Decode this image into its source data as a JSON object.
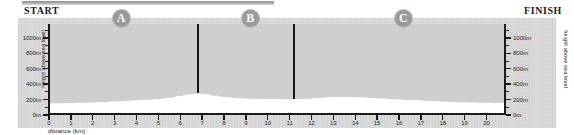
{
  "header": {
    "start_label": "START",
    "finish_label": "FINISH",
    "top_rule": "decorative-rule"
  },
  "markers": [
    {
      "label": "A",
      "km": 3.3
    },
    {
      "label": "B",
      "km": 9.2
    },
    {
      "label": "C",
      "km": 16.2
    }
  ],
  "dividers": [
    {
      "km": 6.8,
      "top_m": 1180,
      "bottom_m": 280
    },
    {
      "km": 11.2,
      "top_m": 1180,
      "bottom_m": 205
    }
  ],
  "colors": {
    "panel_bg": "#d6d6d6",
    "plot_bg": "#cfcfcf",
    "profile_fill": "#ffffff",
    "axis": "#1a1a1a",
    "marker_circle": "#9a9a9a",
    "marker_text": "#ffffff",
    "text": "#1c1c1c"
  },
  "chart_data": {
    "type": "area",
    "title": "",
    "xlabel": "distance (km)",
    "ylabel": "height above sea level",
    "ylabel_right": "height above sea level",
    "xlim": [
      0,
      20.8
    ],
    "ylim": [
      0,
      1180
    ],
    "grid": false,
    "legend": null,
    "x_ticks": [
      0,
      1,
      2,
      3,
      4,
      5,
      6,
      7,
      8,
      9,
      10,
      11,
      12,
      13,
      14,
      15,
      16,
      17,
      18,
      19,
      20
    ],
    "x_tick_labels": [
      "0",
      "1",
      "2",
      "3",
      "4",
      "5",
      "6",
      "7",
      "8",
      "9",
      "10",
      "11",
      "12",
      "13",
      "14",
      "15",
      "16",
      "17",
      "18",
      "19",
      "20"
    ],
    "y_ticks": [
      0,
      200,
      400,
      600,
      800,
      1000
    ],
    "y_tick_labels": [
      "0m",
      "200m",
      "400m",
      "600m",
      "800m",
      "1000m"
    ],
    "y_tick_labels_right": [
      "0m",
      "200m",
      "400m",
      "600m",
      "800m",
      "1000m"
    ],
    "y_minor_ticks": [
      100,
      300,
      500,
      700,
      900,
      1100
    ],
    "series": [
      {
        "name": "course elevation profile",
        "x": [
          0,
          0.5,
          1,
          1.5,
          2,
          2.5,
          3,
          3.5,
          4,
          4.5,
          5,
          5.5,
          6,
          6.4,
          6.8,
          7.2,
          7.6,
          8,
          8.6,
          9.2,
          10,
          10.6,
          11.2,
          11.8,
          12.4,
          13,
          13.6,
          14.2,
          15,
          15.8,
          16.6,
          17.4,
          18.2,
          19,
          19.8,
          20.8
        ],
        "y": [
          150,
          152,
          155,
          158,
          162,
          168,
          175,
          182,
          190,
          198,
          208,
          222,
          245,
          265,
          280,
          268,
          248,
          232,
          218,
          210,
          206,
          205,
          205,
          212,
          222,
          232,
          235,
          230,
          218,
          205,
          193,
          182,
          173,
          166,
          160,
          155
        ]
      }
    ]
  }
}
